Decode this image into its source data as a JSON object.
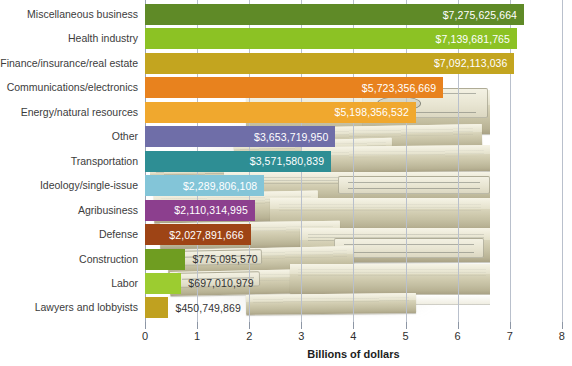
{
  "chart_data": {
    "type": "bar",
    "orientation": "horizontal",
    "title": "",
    "xlabel": "Billions of dollars",
    "ylabel": "",
    "xlim": [
      0,
      8
    ],
    "xticks": [
      "0",
      "1",
      "2",
      "3",
      "4",
      "5",
      "6",
      "7",
      "8"
    ],
    "grid": true,
    "legend": "none",
    "units": "dollars",
    "categories": [
      "Miscellaneous business",
      "Health industry",
      "Finance/insurance/real estate",
      "Communications/electronics",
      "Energy/natural resources",
      "Other",
      "Transportation",
      "Ideology/single-issue",
      "Agribusiness",
      "Defense",
      "Construction",
      "Labor",
      "Lawyers and lobbyists"
    ],
    "values": [
      7275625664,
      7139681765,
      7092113036,
      5723356669,
      5198356532,
      3653719950,
      3571580839,
      2289806108,
      2110314995,
      2027891666,
      775095570,
      697010979,
      450749869
    ],
    "value_labels": [
      "$7,275,625,664",
      "$7,139,681,765",
      "$7,092,113,036",
      "$5,723,356,669",
      "$5,198,356,532",
      "$3,653,719,950",
      "$3,571,580,839",
      "$2,289,806,108",
      "$2,110,314,995",
      "$2,027,891,666",
      "$775,095,570",
      "$697,010,979",
      "$450,749,869"
    ],
    "label_inside": [
      true,
      true,
      true,
      true,
      true,
      true,
      true,
      true,
      true,
      true,
      false,
      false,
      false
    ],
    "colors": [
      "#5f8a27",
      "#8cc224",
      "#c3a51f",
      "#e8821e",
      "#f0a82e",
      "#6f6ea8",
      "#2e8e94",
      "#83c5d8",
      "#8c3f8e",
      "#9e4415",
      "#6f9d21",
      "#9ccc30",
      "#c0a120"
    ]
  },
  "axis": {
    "title": "Billions of dollars"
  }
}
